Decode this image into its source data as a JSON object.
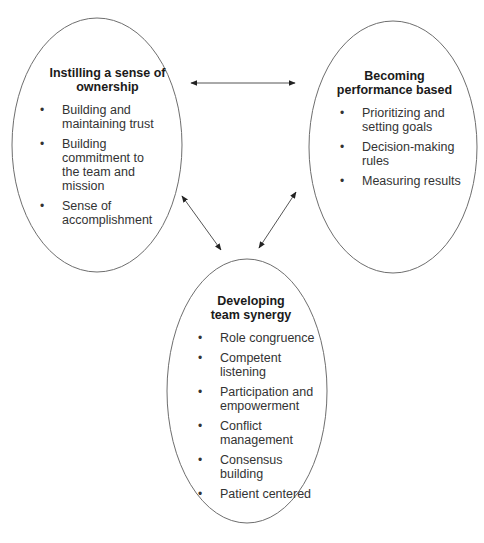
{
  "diagram": {
    "nodes": [
      {
        "title": "Instilling a sense of ownership",
        "title_lines": [
          "Instilling a sense of",
          "ownership"
        ],
        "items": [
          "Building and maintaining trust",
          "Building commitment to the team and mission",
          "Sense of accomplishment"
        ]
      },
      {
        "title": "Becoming performance based",
        "title_lines": [
          "Becoming",
          "performance based"
        ],
        "items": [
          "Prioritizing and setting goals",
          "Decision-making rules",
          "Measuring results"
        ]
      },
      {
        "title": "Developing team synergy",
        "title_lines": [
          "Developing",
          "team synergy"
        ],
        "items": [
          "Role congruence",
          "Competent listening",
          "Participation and empowerment",
          "Conflict management",
          "Consensus building",
          "Patient centered"
        ]
      }
    ],
    "edges": [
      {
        "from": "Instilling a sense of ownership",
        "to": "Becoming performance based",
        "type": "bidirectional"
      },
      {
        "from": "Instilling a sense of ownership",
        "to": "Developing team synergy",
        "type": "bidirectional"
      },
      {
        "from": "Becoming performance based",
        "to": "Developing team synergy",
        "type": "bidirectional"
      }
    ],
    "bullet": "•",
    "colors": {
      "stroke": "#6e6e6e",
      "arrow": "#222222",
      "text": "#333333"
    }
  }
}
